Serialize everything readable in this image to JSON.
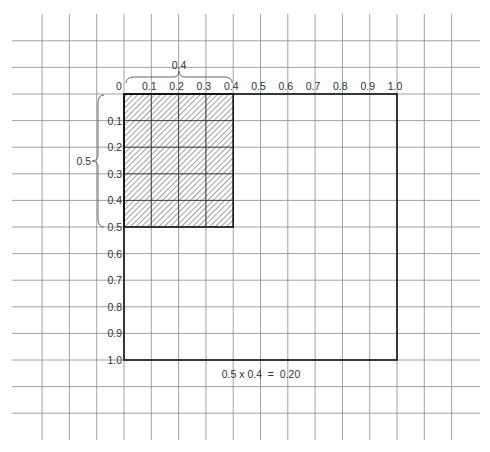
{
  "diagram": {
    "x_axis_labels": [
      "0",
      "0.1",
      "0.2",
      "0.3",
      "0.4",
      "0.5",
      "0.6",
      "0.7",
      "0.8",
      "0.9",
      "1.0"
    ],
    "y_axis_labels": [
      "0.1",
      "0.2",
      "0.3",
      "0.4",
      "0.5",
      "0.6",
      "0.7",
      "0.8",
      "0.9",
      "1.0"
    ],
    "shaded_width": 0.4,
    "shaded_height": 0.5,
    "width_brace_label": "0.4",
    "height_brace_label": "0.5",
    "equation": "0.5 x 0.4  =  0.20",
    "colors": {
      "grid": "#8a8a8a",
      "outline": "#111111",
      "hatch": "#444444"
    }
  }
}
